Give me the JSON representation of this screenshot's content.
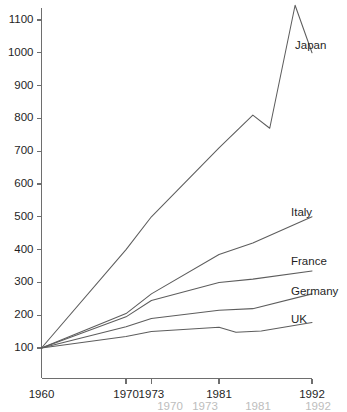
{
  "chart_data": {
    "type": "line",
    "title": "",
    "subtitle": "",
    "xlabel": "",
    "ylabel": "",
    "xlim": [
      1960,
      1992
    ],
    "ylim": [
      100,
      1100
    ],
    "grid": false,
    "legend_position": "right-inline-labels",
    "note": "Index values, 1960 = 100",
    "x_ticks": [
      1960,
      1970,
      1973,
      1981,
      1992
    ],
    "x_tick_labels": [
      "1960",
      "1970",
      "1973",
      "1981",
      "1992"
    ],
    "y_ticks": [
      100,
      200,
      300,
      400,
      500,
      600,
      700,
      800,
      900,
      1000,
      1100
    ],
    "y_tick_labels": [
      "100",
      "200",
      "300",
      "400",
      "500",
      "600",
      "700",
      "800",
      "900",
      "1000",
      "1100"
    ],
    "series": [
      {
        "name": "Japan",
        "label": "Japan",
        "color": "#5d5d5d",
        "x": [
          1960,
          1970,
          1973,
          1981,
          1985,
          1987,
          1990,
          1992
        ],
        "values": [
          100,
          400,
          500,
          710,
          810,
          770,
          1145,
          1000
        ]
      },
      {
        "name": "Italy",
        "label": "Italy",
        "color": "#5d5d5d",
        "x": [
          1960,
          1970,
          1973,
          1981,
          1985,
          1992
        ],
        "values": [
          100,
          205,
          265,
          385,
          420,
          500
        ]
      },
      {
        "name": "France",
        "label": "France",
        "color": "#5d5d5d",
        "x": [
          1960,
          1970,
          1973,
          1981,
          1985,
          1992
        ],
        "values": [
          100,
          195,
          245,
          300,
          310,
          335
        ]
      },
      {
        "name": "Germany",
        "label": "Germany",
        "color": "#5d5d5d",
        "x": [
          1960,
          1970,
          1973,
          1981,
          1985,
          1992
        ],
        "values": [
          100,
          165,
          190,
          215,
          220,
          265
        ]
      },
      {
        "name": "UK",
        "label": "UK",
        "color": "#5d5d5d",
        "x": [
          1960,
          1970,
          1973,
          1981,
          1983,
          1986,
          1992
        ],
        "values": [
          100,
          135,
          150,
          163,
          148,
          152,
          178
        ]
      }
    ]
  },
  "axes": {
    "y_axis_name": "index-axis",
    "x_axis_name": "year-axis"
  },
  "artifact": {
    "visible": true,
    "labels": [
      "1970",
      "1973",
      "1981",
      "1992"
    ]
  }
}
